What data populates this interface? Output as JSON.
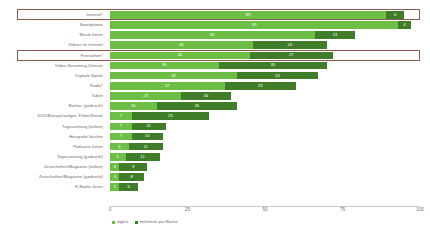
{
  "chart_data": {
    "type": "bar",
    "orientation": "horizontal",
    "stacked": true,
    "title": "",
    "xlabel": "",
    "ylabel": "",
    "xlim": [
      0,
      100
    ],
    "xticks": [
      "0",
      "25",
      "50",
      "75",
      "100"
    ],
    "grid": false,
    "legend_position": "bottom-left",
    "categories": [
      "Internet*",
      "Smartphone",
      "Musik hören",
      "Videos im Internet",
      "Fernsehen*",
      "Video-Streaming-Dienste",
      "Digitale Spiele",
      "Radio*",
      "Tablet",
      "Bücher (gedruckt)",
      "DVD/Blurays/aufgez. Filme/Serien",
      "Tageszeitung (online)",
      "Hörspiele/-bücher",
      "Podcasts hören",
      "Tageszeitung (gedruckt)",
      "Zeitschriften/Magazine (online)",
      "Zeitschriften/Magazine (gedruckt)",
      "E-Books lesen"
    ],
    "series": [
      {
        "name": "täglich",
        "color": "#6cbe45",
        "values": [
          89,
          93,
          66,
          46,
          45,
          35,
          41,
          37,
          23,
          15,
          7,
          7,
          7,
          6,
          5,
          3,
          3,
          3
        ]
      },
      {
        "name": "mehrmals pro Woche",
        "color": "#3f7d28",
        "values": [
          6,
          4,
          13,
          24,
          27,
          35,
          26,
          23,
          16,
          26,
          25,
          11,
          10,
          11,
          11,
          9,
          8,
          6
        ]
      }
    ],
    "highlighted_categories": [
      "Internet*",
      "Fernsehen*"
    ],
    "highlight_color": "#8a5a4a"
  }
}
